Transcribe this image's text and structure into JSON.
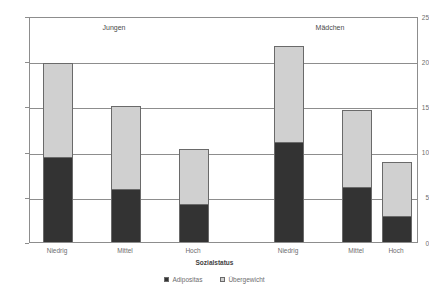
{
  "chart_data": {
    "type": "bar",
    "subtype": "stacked",
    "title": "",
    "xlabel": "Sozialstatus",
    "ylabel": "",
    "ylim": [
      0,
      25
    ],
    "yticks": [
      0,
      5,
      10,
      15,
      20,
      25
    ],
    "ytick_labels": [
      "0",
      "5",
      "10",
      "15",
      "20",
      "25"
    ],
    "grid": true,
    "legend_position": "bottom",
    "panels": [
      "Jungen",
      "Mädchen"
    ],
    "categories": [
      "Niedrig",
      "Mittel",
      "Hoch",
      "Niedrig",
      "Mittel",
      "Hoch"
    ],
    "series": [
      {
        "name": "Adipositas",
        "color": "#333333",
        "values": [
          9.3,
          5.8,
          4.1,
          10.9,
          6.0,
          2.8
        ]
      },
      {
        "name": "Übergewicht",
        "color": "#d0d0d0",
        "values": [
          10.5,
          9.3,
          6.2,
          10.8,
          8.6,
          6.0
        ]
      }
    ],
    "totals": [
      19.8,
      15.1,
      10.3,
      21.7,
      14.6,
      8.8
    ]
  },
  "axis": {
    "y_ticks": [
      {
        "label": "25",
        "value": 25
      },
      {
        "label": "20",
        "value": 20
      },
      {
        "label": "15",
        "value": 15
      },
      {
        "label": "10",
        "value": 10
      },
      {
        "label": "5",
        "value": 5
      },
      {
        "label": "0",
        "value": 0
      }
    ],
    "x_title": "Sozialstatus"
  },
  "panels": [
    {
      "label": "Jungen"
    },
    {
      "label": "Mädchen"
    }
  ],
  "legend": {
    "items": [
      {
        "label": "Adipositas",
        "color": "#333333"
      },
      {
        "label": "Übergewicht",
        "color": "#d0d0d0"
      }
    ]
  },
  "colors": {
    "adipositas": "#333333",
    "uebergewicht": "#d0d0d0",
    "axis": "#8d8d8d",
    "text": "#6d6d6d",
    "background": "#ffffff"
  }
}
